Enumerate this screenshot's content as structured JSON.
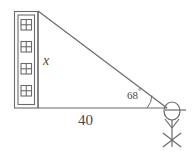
{
  "figure": {
    "type": "right-triangle-angle-of-elevation",
    "stroke_color": "#6b6b6b",
    "text_color": "#4a4a4a",
    "background_color": "#ffffff",
    "labels": {
      "height_side": "x",
      "base_side": "40",
      "angle_value": "68",
      "angle_degree_symbol": "°"
    },
    "geometry": {
      "apex_top": [
        38,
        11
      ],
      "right_angle_corner": [
        38,
        108
      ],
      "observer_corner": [
        167,
        108
      ],
      "base_length_label": "40",
      "height_label": "x",
      "angle_at_observer_degrees": 68
    },
    "building": {
      "left": 14,
      "top": 11,
      "right": 38,
      "bottom": 108,
      "window_count": 4,
      "window_panes": 4
    },
    "observer": {
      "name": "stick-figure-person",
      "head_center": [
        172,
        111
      ],
      "has_hat_brim": true
    }
  }
}
